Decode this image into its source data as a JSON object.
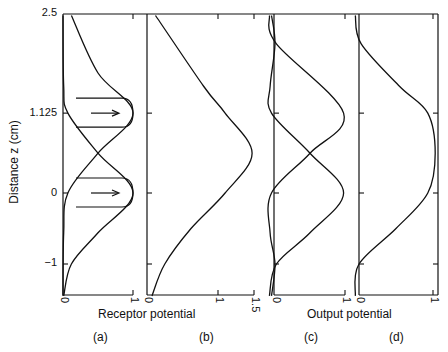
{
  "chart_data": [
    {
      "panel": "(a)",
      "type": "line",
      "title": "",
      "xlabel": "Receptor potential",
      "ylabel": "Distance z (cm)",
      "xlim": [
        0,
        1
      ],
      "ylim": [
        -1.45,
        2.5
      ],
      "xticks": [
        "0",
        "1"
      ],
      "yticks": [
        "2.5",
        "1.125",
        "0",
        "-1"
      ],
      "series": [
        {
          "name": "receptor-at-0",
          "z": [
            2.5,
            1.5,
            1.125,
            0.56,
            0,
            -0.56,
            -1,
            -1.45
          ],
          "values": [
            0.0,
            0.01,
            0.07,
            0.5,
            1.0,
            0.5,
            0.12,
            0.01
          ]
        },
        {
          "name": "receptor-at-1.125",
          "z": [
            2.5,
            1.69,
            1.125,
            0.56,
            0,
            -0.56,
            -1.45
          ],
          "values": [
            0.12,
            0.5,
            1.0,
            0.5,
            0.07,
            0.01,
            0.0
          ]
        }
      ],
      "annotations": [
        {
          "type": "arrow",
          "z": 1.125,
          "direction": "right"
        },
        {
          "type": "arrow",
          "z": 0,
          "direction": "right"
        }
      ]
    },
    {
      "panel": "(b)",
      "type": "line",
      "xlabel": "Receptor potential",
      "xlim": [
        0,
        1.5
      ],
      "xticks": [
        "0",
        "1",
        "1.5"
      ],
      "series": [
        {
          "name": "summed-receptor",
          "z": [
            2.5,
            1.5,
            1.125,
            0.56,
            0,
            -0.5,
            -1,
            -1.45
          ],
          "values": [
            0.12,
            0.8,
            1.1,
            1.48,
            1.1,
            0.62,
            0.25,
            0.07
          ]
        }
      ]
    },
    {
      "panel": "(c)",
      "type": "line",
      "xlabel": "Output potential",
      "xlim": [
        0,
        1
      ],
      "xticks": [
        "0",
        "1"
      ],
      "series": [
        {
          "name": "output-at-0",
          "z": [
            2.5,
            2.1,
            1.5,
            1.125,
            0.56,
            0,
            -0.56,
            -1,
            -1.45
          ],
          "values": [
            -0.05,
            0.0,
            -0.07,
            -0.05,
            0.5,
            0.98,
            0.5,
            0.02,
            -0.08
          ]
        },
        {
          "name": "output-at-1.125",
          "z": [
            2.5,
            2.1,
            1.125,
            0.56,
            0,
            -0.56,
            -1,
            -1.45
          ],
          "values": [
            -0.08,
            0.02,
            0.98,
            0.5,
            -0.05,
            -0.07,
            0.0,
            -0.05
          ]
        }
      ]
    },
    {
      "panel": "(d)",
      "type": "line",
      "xlabel": "Output potential",
      "xlim": [
        0,
        1
      ],
      "xticks": [
        "0",
        "1"
      ],
      "series": [
        {
          "name": "summed-output",
          "z": [
            2.5,
            2.1,
            1.5,
            1.125,
            0.56,
            0,
            -0.5,
            -1,
            -1.45
          ],
          "values": [
            -0.05,
            0.03,
            0.55,
            0.93,
            1.03,
            0.93,
            0.5,
            0.0,
            -0.05
          ]
        }
      ]
    }
  ],
  "labels": {
    "ylabel": "Distance z (cm)",
    "yticks": [
      "2.5",
      "1.125",
      "0",
      "−1"
    ],
    "receptor_xlabel": "Receptor potential",
    "output_xlabel": "Output potential",
    "a_ticks": [
      "0",
      "1"
    ],
    "b_ticks": [
      "0",
      "1",
      "1.5"
    ],
    "c_ticks": [
      "0",
      "1"
    ],
    "d_ticks": [
      "0",
      "1"
    ],
    "panels": [
      "(a)",
      "(b)",
      "(c)",
      "(d)"
    ]
  }
}
